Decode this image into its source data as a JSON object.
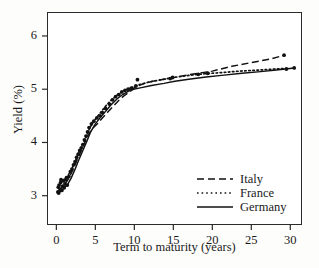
{
  "chart_data": {
    "type": "line",
    "title": "",
    "xlabel": "Term to maturity (years)",
    "ylabel": "Yield (%)",
    "xlim": [
      -1.2,
      31.5
    ],
    "ylim": [
      2.45,
      6.45
    ],
    "xticks": [
      0,
      5,
      10,
      15,
      20,
      25,
      30
    ],
    "yticks": [
      3,
      4,
      5,
      6
    ],
    "grid": false,
    "legend_position": "bottom-right",
    "series": [
      {
        "name": "Italy",
        "style": "dashed",
        "x": [
          0.2,
          0.5,
          0.8,
          1.1,
          1.5,
          2.0,
          2.5,
          3.0,
          3.5,
          4.0,
          4.6,
          5.2,
          5.9,
          6.6,
          7.3,
          8.0,
          8.7,
          9.4,
          10.2,
          11.5,
          13.0,
          14.8,
          16.5,
          18.2,
          20.0,
          22.5,
          25.0,
          27.5,
          29.3
        ],
        "y": [
          3.07,
          3.12,
          3.18,
          3.22,
          3.3,
          3.45,
          3.62,
          3.78,
          3.95,
          4.12,
          4.26,
          4.34,
          4.46,
          4.57,
          4.68,
          4.79,
          4.88,
          4.95,
          5.05,
          5.12,
          5.17,
          5.21,
          5.26,
          5.3,
          5.34,
          5.43,
          5.5,
          5.57,
          5.64
        ]
      },
      {
        "name": "France",
        "style": "dotted",
        "x": [
          0.25,
          0.6,
          0.9,
          1.3,
          1.8,
          2.3,
          2.8,
          3.3,
          3.8,
          4.3,
          4.9,
          5.6,
          6.3,
          7.0,
          7.7,
          8.4,
          9.1,
          9.8,
          10.5,
          12.0,
          13.5,
          15.0,
          17.0,
          19.0,
          21.0,
          23.5,
          26.0,
          28.0,
          29.4
        ],
        "y": [
          3.16,
          3.25,
          3.3,
          3.34,
          3.45,
          3.6,
          3.78,
          3.94,
          4.1,
          4.28,
          4.42,
          4.55,
          4.68,
          4.79,
          4.88,
          4.95,
          5.0,
          5.04,
          5.08,
          5.14,
          5.18,
          5.22,
          5.26,
          5.29,
          5.31,
          5.34,
          5.36,
          5.38,
          5.39
        ]
      },
      {
        "name": "Germany",
        "style": "solid",
        "x": [
          0.3,
          0.7,
          1.0,
          1.4,
          1.9,
          2.4,
          2.9,
          3.4,
          3.9,
          4.4,
          5.0,
          5.7,
          6.4,
          7.1,
          7.8,
          8.5,
          9.2,
          9.9,
          10.6,
          12.2,
          13.8,
          15.2,
          17.2,
          19.2,
          21.2,
          23.8,
          26.2,
          28.2,
          30.5
        ],
        "y": [
          3.05,
          3.1,
          3.15,
          3.2,
          3.33,
          3.5,
          3.68,
          3.85,
          4.02,
          4.2,
          4.35,
          4.48,
          4.6,
          4.72,
          4.82,
          4.9,
          4.96,
          5.0,
          5.02,
          5.07,
          5.11,
          5.15,
          5.19,
          5.23,
          5.26,
          5.3,
          5.33,
          5.36,
          5.4
        ]
      }
    ],
    "scatter_points": {
      "description": "observed bond yield observations",
      "x": [
        0.2,
        0.25,
        0.3,
        0.35,
        0.5,
        0.55,
        0.6,
        0.7,
        0.8,
        0.9,
        1.0,
        1.1,
        1.2,
        1.3,
        1.4,
        1.6,
        1.8,
        2.0,
        2.2,
        2.4,
        2.6,
        2.8,
        3.0,
        3.2,
        3.4,
        3.6,
        3.8,
        4.0,
        4.2,
        4.5,
        4.8,
        5.2,
        5.6,
        5.9,
        6.3,
        6.8,
        7.2,
        7.6,
        8.0,
        8.4,
        8.8,
        9.2,
        9.6,
        10.2,
        10.4,
        14.6,
        14.9,
        18.2,
        19.4,
        29.2,
        29.5,
        30.5
      ],
      "y": [
        3.07,
        3.16,
        3.05,
        3.2,
        3.12,
        3.25,
        3.3,
        3.1,
        3.18,
        3.28,
        3.15,
        3.22,
        3.3,
        3.34,
        3.2,
        3.36,
        3.45,
        3.5,
        3.58,
        3.64,
        3.72,
        3.78,
        3.85,
        3.9,
        3.96,
        4.05,
        4.12,
        4.2,
        4.28,
        4.35,
        4.4,
        4.46,
        4.5,
        4.56,
        4.64,
        4.72,
        4.8,
        4.86,
        4.9,
        4.95,
        4.98,
        5.0,
        5.02,
        5.06,
        5.18,
        5.2,
        5.22,
        5.28,
        5.3,
        5.64,
        5.38,
        5.4
      ]
    }
  },
  "axes": {
    "x_title": "Term to maturity (years)",
    "y_title": "Yield (%)",
    "x_tick_labels": [
      "0",
      "5",
      "10",
      "15",
      "20",
      "25",
      "30"
    ],
    "y_tick_labels": [
      "3",
      "4",
      "5",
      "6"
    ]
  },
  "legend": {
    "entries": [
      {
        "label": "Italy",
        "style": "dashed"
      },
      {
        "label": "France",
        "style": "dotted"
      },
      {
        "label": "Germany",
        "style": "solid"
      }
    ]
  },
  "colors": {
    "line": "#111111",
    "frame": "#2b2b2b",
    "background": "#ffffff",
    "text": "#1a1a1a"
  }
}
